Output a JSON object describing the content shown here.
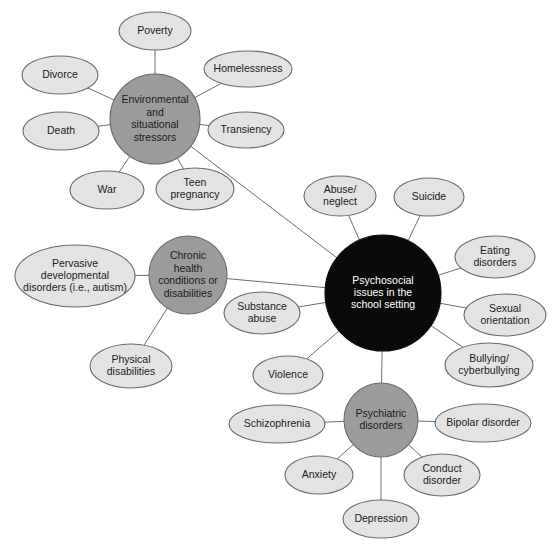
{
  "diagram": {
    "type": "concept-map",
    "background_color": "#ffffff",
    "colors": {
      "center_node_fill": "#0a0a0a",
      "center_node_text": "#ffffff",
      "hub_node_fill": "#9b9b9b",
      "leaf_node_fill": "#e3e3e3",
      "node_stroke": "#6b6b6b",
      "edge_stroke": "#6e6e6e",
      "text": "#1c1c1c"
    }
  },
  "nodes": {
    "center": {
      "id": "psychosocial-issues",
      "label": "Psychosocial issues in the school setting",
      "lines": [
        "Psychosocial",
        "issues in the",
        "school setting"
      ],
      "shape": "circle",
      "role": "center",
      "cx": 383,
      "cy": 293,
      "r": 58
    },
    "hubs": [
      {
        "id": "environmental-stressors",
        "label": "Environmental and situational stressors",
        "lines": [
          "Environmental",
          "and",
          "situational",
          "stressors"
        ],
        "shape": "circle",
        "role": "hub",
        "cx": 155,
        "cy": 119,
        "r": 45
      },
      {
        "id": "chronic-health",
        "label": "Chronic health conditions or disabilities",
        "lines": [
          "Chronic",
          "health",
          "conditions or",
          "disabilities"
        ],
        "shape": "circle",
        "role": "hub",
        "cx": 188,
        "cy": 275,
        "r": 39
      },
      {
        "id": "psychiatric-disorders",
        "label": "Psychiatric disorders",
        "lines": [
          "Psychiatric",
          "disorders"
        ],
        "shape": "circle",
        "role": "hub",
        "cx": 381,
        "cy": 420,
        "r": 37
      }
    ],
    "leaves": [
      {
        "id": "poverty",
        "label": "Poverty",
        "lines": [
          "Poverty"
        ],
        "parent": "environmental-stressors",
        "cx": 155,
        "cy": 31,
        "rx": 36,
        "ry": 19
      },
      {
        "id": "homelessness",
        "label": "Homelessness",
        "lines": [
          "Homelessness"
        ],
        "parent": "environmental-stressors",
        "cx": 248,
        "cy": 69,
        "rx": 44,
        "ry": 18
      },
      {
        "id": "transiency",
        "label": "Transiency",
        "lines": [
          "Transiency"
        ],
        "parent": "environmental-stressors",
        "cx": 246,
        "cy": 130,
        "rx": 38,
        "ry": 18
      },
      {
        "id": "teen-pregnancy",
        "label": "Teen pregnancy",
        "lines": [
          "Teen",
          "pregnancy"
        ],
        "parent": "environmental-stressors",
        "cx": 195,
        "cy": 189,
        "rx": 39,
        "ry": 21
      },
      {
        "id": "war",
        "label": "War",
        "lines": [
          "War"
        ],
        "parent": "environmental-stressors",
        "cx": 107,
        "cy": 190,
        "rx": 37,
        "ry": 19
      },
      {
        "id": "death",
        "label": "Death",
        "lines": [
          "Death"
        ],
        "parent": "environmental-stressors",
        "cx": 61,
        "cy": 131,
        "rx": 38,
        "ry": 19
      },
      {
        "id": "divorce",
        "label": "Divorce",
        "lines": [
          "Divorce"
        ],
        "parent": "environmental-stressors",
        "cx": 60,
        "cy": 75,
        "rx": 38,
        "ry": 19
      },
      {
        "id": "pervasive-developmental-disorders",
        "label": "Pervasive developmental disorders (i.e., autism)",
        "lines": [
          "Pervasive",
          "developmental",
          "disorders (i.e., autism)"
        ],
        "parent": "chronic-health",
        "cx": 75,
        "cy": 276,
        "rx": 60,
        "ry": 31
      },
      {
        "id": "physical-disabilities",
        "label": "Physical disabilities",
        "lines": [
          "Physical",
          "disabilities"
        ],
        "parent": "chronic-health",
        "cx": 131,
        "cy": 366,
        "rx": 41,
        "ry": 22
      },
      {
        "id": "abuse-neglect",
        "label": "Abuse/ neglect",
        "lines": [
          "Abuse/",
          "neglect"
        ],
        "parent": "psychosocial-issues",
        "cx": 340,
        "cy": 196,
        "rx": 36,
        "ry": 20
      },
      {
        "id": "suicide",
        "label": "Suicide",
        "lines": [
          "Suicide"
        ],
        "parent": "psychosocial-issues",
        "cx": 429,
        "cy": 197,
        "rx": 35,
        "ry": 19
      },
      {
        "id": "eating-disorders",
        "label": "Eating disorders",
        "lines": [
          "Eating",
          "disorders"
        ],
        "parent": "psychosocial-issues",
        "cx": 495,
        "cy": 257,
        "rx": 40,
        "ry": 21
      },
      {
        "id": "sexual-orientation",
        "label": "Sexual orientation",
        "lines": [
          "Sexual",
          "orientation"
        ],
        "parent": "psychosocial-issues",
        "cx": 505,
        "cy": 315,
        "rx": 41,
        "ry": 21
      },
      {
        "id": "bullying-cyberbullying",
        "label": "Bullying/ cyberbullying",
        "lines": [
          "Bullying/",
          "cyberbullying"
        ],
        "parent": "psychosocial-issues",
        "cx": 489,
        "cy": 365,
        "rx": 44,
        "ry": 22
      },
      {
        "id": "substance-abuse",
        "label": "Substance abuse",
        "lines": [
          "Substance",
          "abuse"
        ],
        "parent": "psychosocial-issues",
        "cx": 262,
        "cy": 313,
        "rx": 38,
        "ry": 21
      },
      {
        "id": "violence",
        "label": "Violence",
        "lines": [
          "Violence"
        ],
        "parent": "psychosocial-issues",
        "cx": 288,
        "cy": 375,
        "rx": 35,
        "ry": 19
      },
      {
        "id": "schizophrenia",
        "label": "Schizophrenia",
        "lines": [
          "Schizophrenia"
        ],
        "parent": "psychiatric-disorders",
        "cx": 277,
        "cy": 424,
        "rx": 48,
        "ry": 19
      },
      {
        "id": "bipolar-disorder",
        "label": "Bipolar disorder",
        "lines": [
          "Bipolar disorder"
        ],
        "parent": "psychiatric-disorders",
        "cx": 483,
        "cy": 423,
        "rx": 48,
        "ry": 19
      },
      {
        "id": "anxiety",
        "label": "Anxiety",
        "lines": [
          "Anxiety"
        ],
        "parent": "psychiatric-disorders",
        "cx": 319,
        "cy": 475,
        "rx": 34,
        "ry": 19
      },
      {
        "id": "conduct-disorder",
        "label": "Conduct disorder",
        "lines": [
          "Conduct",
          "disorder"
        ],
        "parent": "psychiatric-disorders",
        "cx": 442,
        "cy": 475,
        "rx": 38,
        "ry": 21
      },
      {
        "id": "depression",
        "label": "Depression",
        "lines": [
          "Depression"
        ],
        "parent": "psychiatric-disorders",
        "cx": 381,
        "cy": 519,
        "rx": 38,
        "ry": 19
      }
    ],
    "hub_links": [
      {
        "from": "environmental-stressors",
        "to": "psychosocial-issues"
      },
      {
        "from": "chronic-health",
        "to": "psychosocial-issues"
      },
      {
        "from": "psychiatric-disorders",
        "to": "psychosocial-issues"
      }
    ]
  }
}
